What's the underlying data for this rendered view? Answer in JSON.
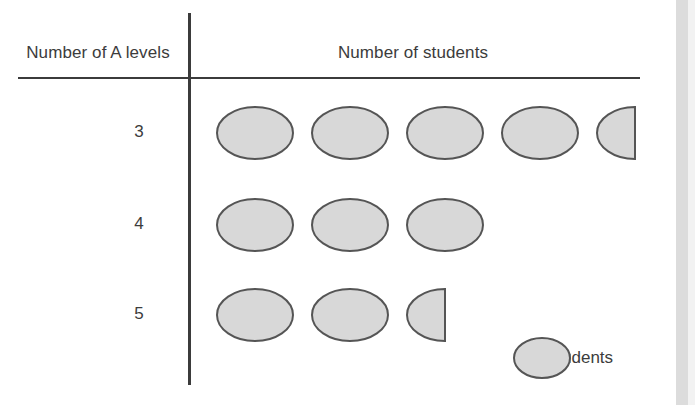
{
  "figure": {
    "type": "pictograph",
    "column_headers": {
      "category": "Number of A levels",
      "value": "Number of students"
    },
    "symbol": {
      "shape": "ellipse",
      "fill_color": "#d8d8d8",
      "stroke_color": "#555555"
    },
    "legend": {
      "equals_text": "= 2 students",
      "unit_value": 2,
      "unit_label": "students"
    },
    "rows": [
      {
        "label": "3",
        "full_symbols": 4,
        "half_symbols": 1,
        "students": 9
      },
      {
        "label": "4",
        "full_symbols": 3,
        "half_symbols": 0,
        "students": 6
      },
      {
        "label": "5",
        "full_symbols": 2,
        "half_symbols": 1,
        "students": 5
      }
    ]
  },
  "chart_data": {
    "type": "bar",
    "title": "",
    "subtitle": "",
    "xlabel": "Number of students",
    "ylabel": "Number of A levels",
    "categories": [
      "3",
      "4",
      "5"
    ],
    "values": [
      9,
      6,
      5
    ],
    "series": [
      {
        "name": "Number of students",
        "values": [
          9,
          6,
          5
        ]
      }
    ],
    "symbol_counts": [
      4.5,
      3,
      2.5
    ],
    "symbol_unit": 2,
    "legend": "= 2 students",
    "legend_position": "bottom-right",
    "grid": false,
    "orientation": "horizontal",
    "xlim": [
      0,
      10
    ]
  }
}
